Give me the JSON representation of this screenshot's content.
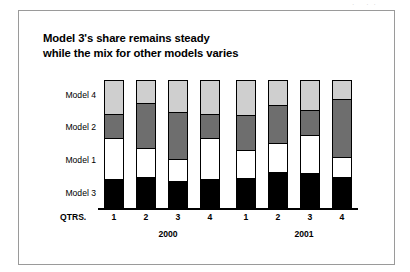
{
  "artifact": {
    "marks": "· ··"
  },
  "chart_data": {
    "type": "bar",
    "subtype": "stacked-100-percent",
    "title": "Model 3's share remains steady while the mix for other models varies",
    "title_line1": "Model 3's share remains steady",
    "title_line2": "while the mix for other models varies",
    "xlabel": "QTRS.",
    "ylabel": "",
    "ylim": [
      0,
      100
    ],
    "grid": false,
    "legend_position": "y-axis-inline-labels",
    "axis_labels": [
      "Model 4",
      "Model 2",
      "Model 1",
      "Model 3"
    ],
    "x_axis_prefix": "QTRS.",
    "categories": [
      "1",
      "2",
      "3",
      "4",
      "1",
      "2",
      "3",
      "4"
    ],
    "groups": [
      {
        "label": "2000",
        "categories": [
          "1",
          "2",
          "3",
          "4"
        ]
      },
      {
        "label": "2001",
        "categories": [
          "1",
          "2",
          "3",
          "4"
        ]
      }
    ],
    "series": [
      {
        "name": "Model 4",
        "color": "#cfcfcf",
        "values": [
          26,
          18,
          25,
          26,
          27,
          19,
          23,
          15
        ]
      },
      {
        "name": "Model 2",
        "color": "#6e6e6e",
        "values": [
          19,
          35,
          36,
          19,
          27,
          30,
          20,
          45
        ]
      },
      {
        "name": "Model 1",
        "color": "#ffffff",
        "values": [
          32,
          22,
          17,
          32,
          22,
          22,
          29,
          15
        ]
      },
      {
        "name": "Model 3",
        "color": "#000000",
        "values": [
          23,
          25,
          22,
          23,
          24,
          29,
          28,
          25
        ]
      }
    ]
  },
  "bars": [
    {
      "quarter": "1",
      "year": "2000",
      "x": 0,
      "segments": [
        26,
        19,
        32,
        23
      ]
    },
    {
      "quarter": "2",
      "year": "2000",
      "x": 32,
      "segments": [
        18,
        35,
        22,
        25
      ]
    },
    {
      "quarter": "3",
      "year": "2000",
      "x": 64,
      "segments": [
        25,
        36,
        17,
        22
      ]
    },
    {
      "quarter": "4",
      "year": "2000",
      "x": 96,
      "segments": [
        26,
        19,
        32,
        23
      ]
    },
    {
      "quarter": "1",
      "year": "2001",
      "x": 132,
      "segments": [
        27,
        27,
        22,
        24
      ]
    },
    {
      "quarter": "2",
      "year": "2001",
      "x": 164,
      "segments": [
        19,
        30,
        22,
        29
      ]
    },
    {
      "quarter": "3",
      "year": "2001",
      "x": 196,
      "segments": [
        23,
        20,
        29,
        28
      ]
    },
    {
      "quarter": "4",
      "year": "2001",
      "x": 228,
      "segments": [
        15,
        45,
        15,
        25
      ]
    }
  ],
  "y_axis": {
    "labels": [
      {
        "text": "Model 4",
        "top": 90
      },
      {
        "text": "Model 2",
        "top": 122
      },
      {
        "text": "Model 1",
        "top": 155
      },
      {
        "text": "Model 3",
        "top": 188
      }
    ]
  },
  "x_axis": {
    "prefix": "QTRS.",
    "ticks": [
      {
        "text": "1",
        "left": 104
      },
      {
        "text": "2",
        "left": 136
      },
      {
        "text": "3",
        "left": 168
      },
      {
        "text": "4",
        "left": 200
      },
      {
        "text": "1",
        "left": 236
      },
      {
        "text": "2",
        "left": 268
      },
      {
        "text": "3",
        "left": 300
      },
      {
        "text": "4",
        "left": 332
      }
    ],
    "years": [
      {
        "text": "2000",
        "left": 138
      },
      {
        "text": "2001",
        "left": 274
      }
    ]
  }
}
